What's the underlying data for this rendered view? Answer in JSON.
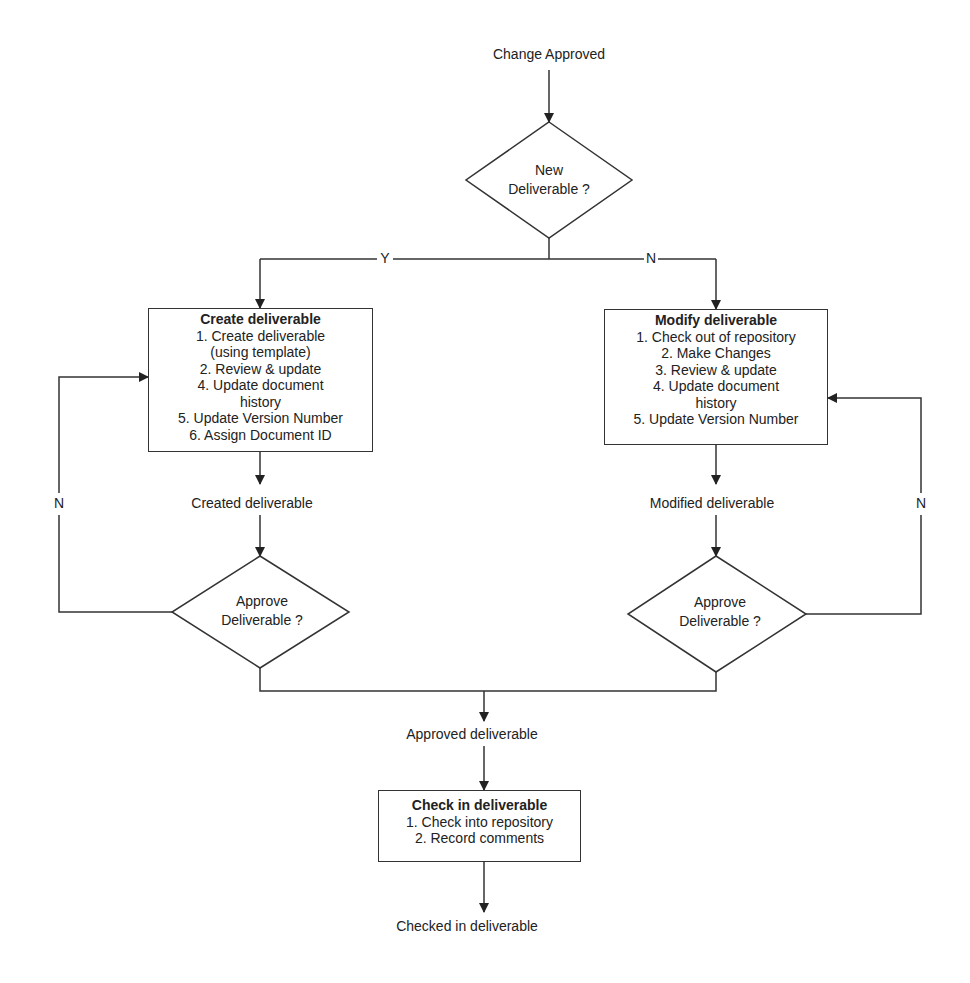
{
  "start_label": "Change Approved",
  "decision_new": {
    "line1": "New",
    "line2": "Deliverable ?"
  },
  "branch_yes": "Y",
  "branch_no": "N",
  "create_box": {
    "title": "Create deliverable",
    "steps": [
      "1. Create deliverable",
      "(using template)",
      "2. Review & update",
      "4. Update document",
      "history",
      "5. Update Version Number",
      "6. Assign Document ID"
    ]
  },
  "modify_box": {
    "title": "Modify deliverable",
    "steps": [
      "1. Check out of repository",
      "2. Make Changes",
      "3. Review & update",
      "4. Update document",
      "history",
      "5. Update Version Number"
    ]
  },
  "created_label": "Created deliverable",
  "modified_label": "Modified deliverable",
  "approve_left": {
    "line1": "Approve",
    "line2": "Deliverable ?"
  },
  "approve_right": {
    "line1": "Approve",
    "line2": "Deliverable ?"
  },
  "loop_left_label": "N",
  "loop_right_label": "N",
  "approved_label": "Approved deliverable",
  "checkin_box": {
    "title": "Check in deliverable",
    "steps": [
      "1. Check into repository",
      "2. Record comments"
    ]
  },
  "end_label": "Checked in deliverable"
}
